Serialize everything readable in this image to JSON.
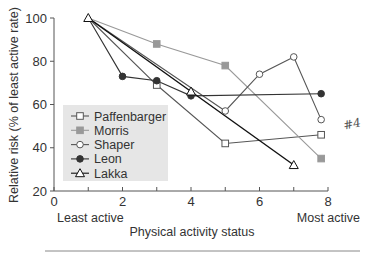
{
  "chart_data": {
    "type": "line",
    "title": "",
    "xlabel": "Physical activity status",
    "ylabel": "Relative risk (% of least active rate)",
    "xlim": [
      0,
      8
    ],
    "ylim": [
      20,
      100
    ],
    "x_ticks": [
      0,
      2,
      4,
      6,
      8
    ],
    "x_minor_ticks": [
      1,
      3,
      5,
      7
    ],
    "y_ticks": [
      20,
      40,
      60,
      80,
      100
    ],
    "x_end_labels": {
      "left": "Least active",
      "right": "Most active"
    },
    "grid": false,
    "legend_position": "lower-left inside",
    "annotation": "#4",
    "series": [
      {
        "name": "Paffenbarger",
        "marker": "open-square",
        "color": "#555555",
        "points": [
          [
            1,
            100
          ],
          [
            3,
            69
          ],
          [
            5,
            42
          ],
          [
            7.8,
            46
          ]
        ]
      },
      {
        "name": "Morris",
        "marker": "filled-square",
        "color": "#999999",
        "points": [
          [
            1,
            100
          ],
          [
            3,
            88
          ],
          [
            5,
            78
          ],
          [
            7.8,
            35
          ]
        ]
      },
      {
        "name": "Shaper",
        "marker": "open-circle",
        "color": "#555555",
        "points": [
          [
            1,
            100
          ],
          [
            5,
            57
          ],
          [
            6,
            74
          ],
          [
            7,
            82
          ],
          [
            7.8,
            53
          ]
        ]
      },
      {
        "name": "Leon",
        "marker": "filled-circle",
        "color": "#333333",
        "points": [
          [
            1,
            100
          ],
          [
            2,
            73
          ],
          [
            3,
            71
          ],
          [
            4,
            64
          ],
          [
            7.8,
            65
          ]
        ]
      },
      {
        "name": "Lakka",
        "marker": "open-triangle",
        "color": "#111111",
        "points": [
          [
            1,
            100
          ],
          [
            4,
            66
          ],
          [
            7,
            32
          ]
        ]
      }
    ]
  }
}
